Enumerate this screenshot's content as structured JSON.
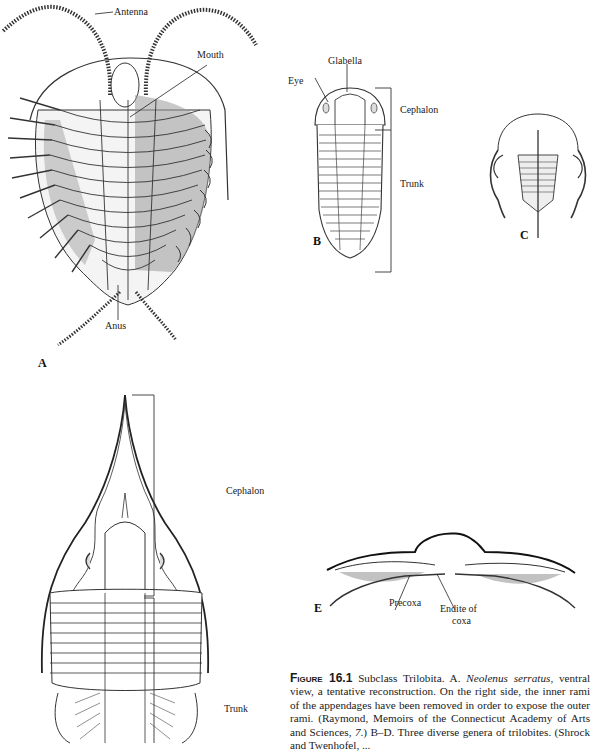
{
  "figure": {
    "panels": {
      "A": {
        "letter": "A",
        "labels": {
          "antenna": "Antenna",
          "mouth": "Mouth",
          "anus": "Anus"
        }
      },
      "B": {
        "letter": "B",
        "labels": {
          "glabella": "Glabella",
          "eye": "Eye",
          "cephalon": "Cephalon",
          "trunk": "Trunk"
        }
      },
      "C": {
        "letter": "C"
      },
      "D": {
        "labels": {
          "cephalon": "Cephalon",
          "trunk": "Trunk"
        }
      },
      "E": {
        "letter": "E",
        "labels": {
          "precoxa": "Precoxa",
          "endite_line1": "Endite of",
          "endite_line2": "coxa"
        }
      }
    },
    "caption": {
      "figure_word": "Figure",
      "figure_number": "16.1",
      "text_1": " Subclass Trilobita. A. ",
      "species": "Neolenus serratus",
      "text_2": ", ventral view, a tentative reconstruction. On the right side, the inner rami of the appendages have been removed in order to expose the outer rami. (Raymond, Memoirs of the Connecticut Academy of Arts and Sciences, ",
      "volume": "7",
      "text_3": ".) B–D. Three diverse genera of trilobites. (Shrock and Twenhofel, ..."
    }
  }
}
